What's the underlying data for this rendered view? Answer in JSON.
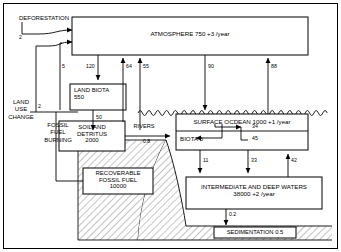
{
  "diagram": {
    "colors": {
      "line": "#000000",
      "background": "#ffffff",
      "hatch": "#9a9a9a",
      "text": "#000000"
    },
    "boxes": {
      "atmosphere": {
        "label": "ATMOSPHERE 750 +3 /year"
      },
      "land_biota": {
        "label": "LAND BIOTA\n550"
      },
      "soil_detritus": {
        "label": "SOIL AND\nDETRITUS\n2000"
      },
      "recoverable_fossil_fuel": {
        "label": "RECOVERABLE\nFOSSIL FUEL\n10000"
      },
      "surface_ocean": {
        "label": "SURFACE OCDEAN 1000 +1 /year"
      },
      "ocean_biota": {
        "label": "BIOTA 3"
      },
      "deep_waters": {
        "label": "INTERMEDIATE AND DEEP WATERS\n38000 +2 /year"
      },
      "sedimentation": {
        "label": "SEDIMENTATION  0.5"
      }
    },
    "side_labels": {
      "deforestation": "DEFORESTATION",
      "land_use_change": "LAND\nUSE\nCHANGE",
      "fossil_fuel_burning": "FOSSIL\nFUEL\nBURNING",
      "rivers": "RIVERS"
    },
    "fluxes": {
      "deforestation_to_atmosphere": "2",
      "land_use_change_to_atmosphere": "2",
      "land_biota_respiration": "5",
      "atmosphere_to_land_biota": "120",
      "soil_to_atmosphere": "64",
      "biota_to_atmosphere": "55",
      "land_biota_to_soil": "50",
      "atmosphere_to_surface_ocean": "90",
      "surface_ocean_to_atmosphere": "88",
      "rivers_input": "0.8",
      "surface_to_ocean_biota": "34",
      "ocean_biota_to_surface": "45",
      "biota_export_down": "11",
      "surface_downwelling": "33",
      "deep_upwelling": "42",
      "deep_to_sediment": "0.2"
    }
  }
}
